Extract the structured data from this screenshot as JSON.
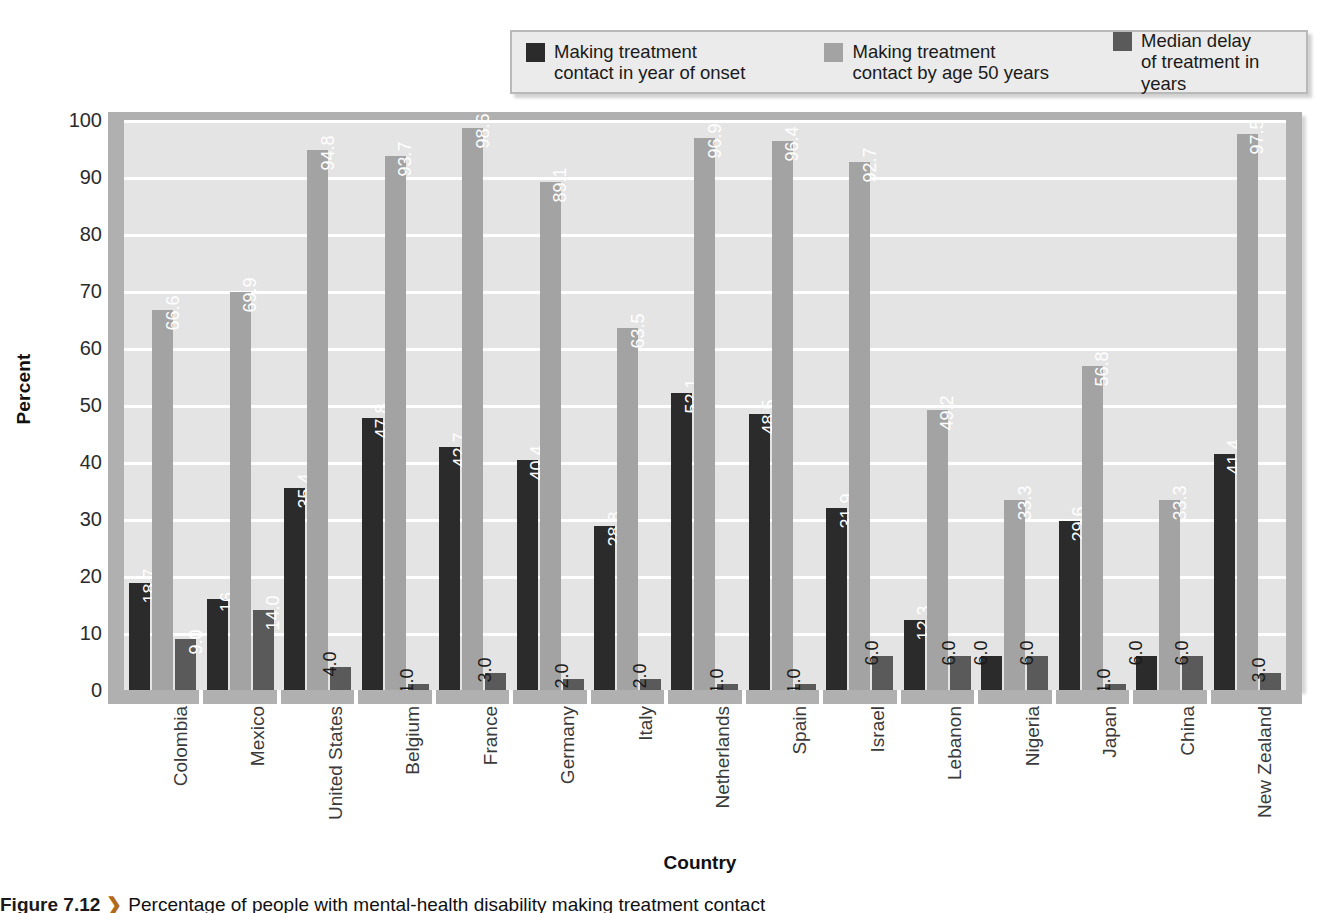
{
  "chart_data": {
    "type": "bar",
    "title": "",
    "xlabel": "Country",
    "ylabel": "Percent",
    "ylim": [
      0,
      100
    ],
    "yticks": [
      100,
      90,
      80,
      70,
      60,
      50,
      40,
      30,
      20,
      10,
      0
    ],
    "grid": true,
    "legend_position": "top",
    "categories": [
      "Colombia",
      "Mexico",
      "United States",
      "Belgium",
      "France",
      "Germany",
      "Italy",
      "Netherlands",
      "Spain",
      "Israel",
      "Lebanon",
      "Nigeria",
      "Japan",
      "China",
      "New Zealand"
    ],
    "series": [
      {
        "name": "Making treatment\ncontact in year of onset",
        "color": "#2b2b2b",
        "values": [
          18.7,
          16,
          35.4,
          47.8,
          42.7,
          40.4,
          28.8,
          52.1,
          48.5,
          31.9,
          12.3,
          6.0,
          29.6,
          6.0,
          41.4
        ],
        "labels": [
          "18.7",
          "16",
          "35.4",
          "47.8",
          "42.7",
          "40.4",
          "28.8",
          "52.1",
          "48.5",
          "31.9",
          "12.3",
          "6.0",
          "29.6",
          "6.0",
          "41.4"
        ]
      },
      {
        "name": "Making treatment\ncontact by age 50 years",
        "color": "#a3a3a3",
        "values": [
          66.6,
          69.9,
          94.8,
          93.7,
          98.6,
          89.1,
          63.5,
          96.9,
          96.4,
          92.7,
          49.2,
          33.3,
          56.8,
          33.3,
          97.5
        ],
        "labels": [
          "66.6",
          "69.9",
          "94.8",
          "93.7",
          "98.6",
          "89.1",
          "63.5",
          "96.9",
          "96.4",
          "92.7",
          "49.2",
          "33.3",
          "56.8",
          "33.3",
          "97.5"
        ]
      },
      {
        "name": "Median delay\nof treatment in years",
        "color": "#5a5a5a",
        "values": [
          9.0,
          14.0,
          4.0,
          1.0,
          3.0,
          2.0,
          2.0,
          1.0,
          1.0,
          6.0,
          6.0,
          6.0,
          1.0,
          6.0,
          3.0
        ],
        "labels": [
          "9.0",
          "14.0",
          "4.0",
          "1.0",
          "3.0",
          "2.0",
          "2.0",
          "1.0",
          "1.0",
          "6.0",
          "6.0",
          "6.0",
          "1.0",
          "6.0",
          "3.0"
        ]
      }
    ]
  },
  "axis": {
    "y_title": "Percent",
    "x_title": "Country"
  },
  "legend": {
    "items": [
      {
        "label": "Making treatment\ncontact in year of onset",
        "color": "#2b2b2b"
      },
      {
        "label": "Making treatment\ncontact by age 50 years",
        "color": "#a3a3a3"
      },
      {
        "label": "Median delay\nof treatment in years",
        "color": "#5a5a5a"
      }
    ]
  },
  "caption": {
    "figure_number": "Figure 7.12",
    "arrow": "❯",
    "text": "Percentage of people with mental-health disability making treatment contact"
  }
}
